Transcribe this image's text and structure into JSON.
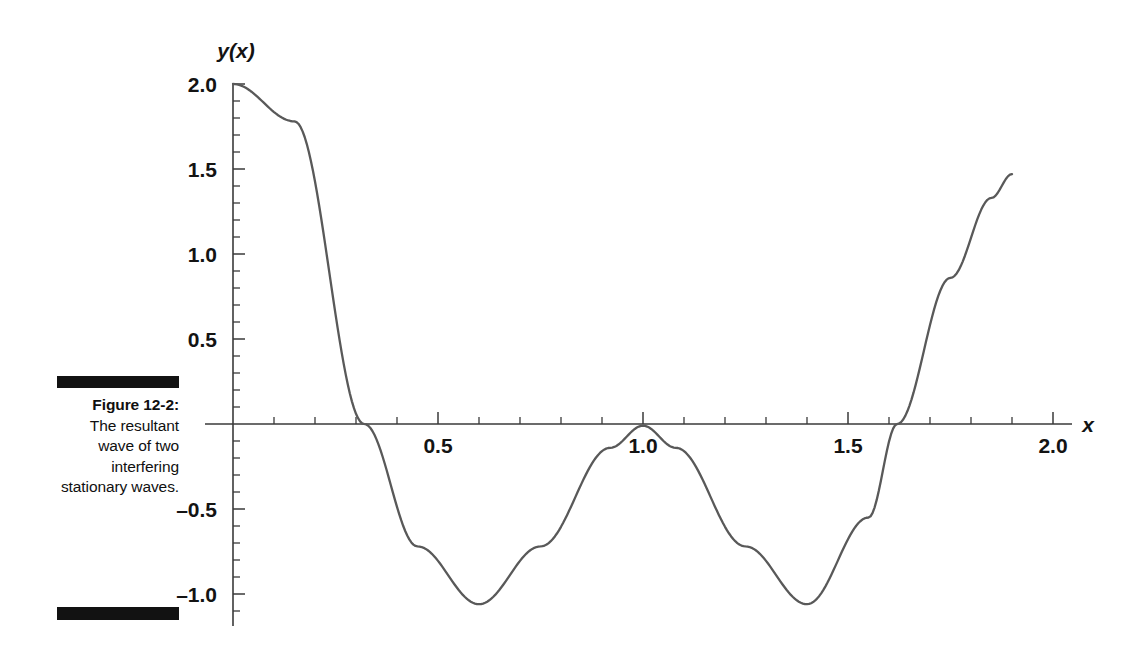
{
  "figure": {
    "caption_title": "Figure 12-2:",
    "caption_body": "The resultant wave of two interfering stationary waves.",
    "rule_color": "#121212"
  },
  "chart_data": {
    "type": "line",
    "title": "",
    "subtitle": "",
    "xlabel": "x",
    "ylabel": "y(x)",
    "xlim": [
      0,
      2.08
    ],
    "ylim": [
      -1.13,
      2.05
    ],
    "grid": false,
    "legend": "none",
    "curve_color": "#595959",
    "axis_color": "#3a3a3a",
    "x_ticks_major": [
      0.5,
      1.0,
      1.5,
      2.0
    ],
    "x_tick_labels": [
      "0.5",
      "1.0",
      "1.5",
      "2.0"
    ],
    "x_tick_minor_step": 0.1,
    "y_ticks_major": [
      2.0,
      1.5,
      1.0,
      0.5,
      -0.5,
      -1.0
    ],
    "y_tick_labels": [
      "2.0",
      "1.5",
      "1.0",
      "0.5",
      "–0.5",
      "–1.0"
    ],
    "y_tick_minor_step": 0.1,
    "annotations": [
      {
        "label": "start",
        "x": 0.0,
        "y": 2.0
      },
      {
        "label": "zero-crossing",
        "x": 0.32,
        "y": 0.0
      },
      {
        "label": "minimum-1",
        "x": 0.6,
        "y": -1.06
      },
      {
        "label": "local-maximum",
        "x": 1.0,
        "y": 0.0
      },
      {
        "label": "minimum-2",
        "x": 1.4,
        "y": -1.06
      },
      {
        "label": "zero-crossing",
        "x": 1.62,
        "y": 0.0
      },
      {
        "label": "end",
        "x": 1.9,
        "y": 1.47
      }
    ],
    "x": [
      0.0,
      0.05,
      0.1,
      0.15,
      0.2,
      0.25,
      0.3,
      0.35,
      0.4,
      0.45,
      0.5,
      0.55,
      0.6,
      0.65,
      0.7,
      0.75,
      0.8,
      0.85,
      0.9,
      0.95,
      1.0,
      1.05,
      1.1,
      1.15,
      1.2,
      1.25,
      1.3,
      1.35,
      1.4,
      1.45,
      1.5,
      1.55,
      1.6,
      1.65,
      1.7,
      1.75,
      1.8,
      1.85,
      1.9
    ],
    "y": [
      2.0,
      1.975,
      1.902,
      1.782,
      1.618,
      1.414,
      1.176,
      0.908,
      0.618,
      0.313,
      0.0,
      -0.313,
      -0.618,
      -0.908,
      -1.176,
      -1.414,
      -1.618,
      -1.782,
      -1.902,
      -1.975,
      -2.0,
      -1.975,
      -1.902,
      -1.782,
      -1.618,
      -1.414,
      -1.176,
      -0.908,
      -0.618,
      -0.313,
      0.0,
      0.313,
      0.618,
      0.908,
      1.176,
      1.414,
      1.618,
      1.782,
      1.902
    ],
    "note": "Rendered curve is y(x) = 1 + cos(2*pi*x) clipped/scaled to the drawn envelope: peaks 2.0 at x=0, troughs about -1.06 at x=0.6 and 1.4, touching zero at x=1.0"
  }
}
